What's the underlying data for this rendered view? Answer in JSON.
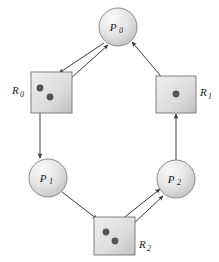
{
  "figure": {
    "background": "#ffffff",
    "width": 219,
    "height": 262
  },
  "style": {
    "process_fill_light": "#f0f0f0",
    "process_fill_dark": "#c9c9c9",
    "resource_fill_light": "#ededed",
    "resource_fill_dark": "#c2c2c2",
    "stroke": "#6e6e6e",
    "edge_color": "#3a3a3a",
    "dot_color": "#555555",
    "text_color": "#1a1a1a"
  },
  "processes": [
    {
      "id": "p0",
      "label": "P",
      "sub": "0",
      "cx": 118,
      "cy": 27,
      "r": 19
    },
    {
      "id": "p1",
      "label": "P",
      "sub": "1",
      "cx": 48,
      "cy": 178,
      "r": 19
    },
    {
      "id": "p2",
      "label": "P",
      "sub": "2",
      "cx": 176,
      "cy": 179,
      "r": 19
    }
  ],
  "resources": [
    {
      "id": "r0",
      "label": "R",
      "sub": "0",
      "x": 31,
      "y": 72,
      "w": 41,
      "h": 41,
      "label_x": 12,
      "label_y": 94,
      "instances": [
        {
          "cx": 40,
          "cy": 88
        },
        {
          "cx": 50,
          "cy": 97
        }
      ]
    },
    {
      "id": "r1",
      "label": "R",
      "sub": "1",
      "x": 156,
      "y": 76,
      "w": 40,
      "h": 37,
      "label_x": 200,
      "label_y": 96,
      "instances": [
        {
          "cx": 176,
          "cy": 94
        }
      ]
    },
    {
      "id": "r2",
      "label": "R",
      "sub": "2",
      "x": 94,
      "y": 217,
      "w": 41,
      "h": 38,
      "label_x": 139,
      "label_y": 248,
      "instances": [
        {
          "cx": 106,
          "cy": 232
        },
        {
          "cx": 115,
          "cy": 241
        }
      ]
    }
  ],
  "edges": [
    {
      "id": "edge-p0-to-r0",
      "kind": "request",
      "from": "p0",
      "to": "r0",
      "x1": 104,
      "y1": 43,
      "x2": 59,
      "y2": 73
    },
    {
      "id": "edge-r0-to-p0",
      "kind": "assignment",
      "from": "r0",
      "to": "p0",
      "x1": 50,
      "y1": 97,
      "x2": 108,
      "y2": 45
    },
    {
      "id": "edge-r1-to-p0",
      "kind": "assignment",
      "from": "r1",
      "to": "p0",
      "x1": 176,
      "y1": 94,
      "x2": 132,
      "y2": 42
    },
    {
      "id": "edge-r0-to-p1",
      "kind": "assignment",
      "from": "r0",
      "to": "p1",
      "x1": 40,
      "y1": 88,
      "x2": 40,
      "y2": 158
    },
    {
      "id": "edge-p2-to-r1",
      "kind": "request",
      "from": "p2",
      "to": "r1",
      "x1": 176,
      "y1": 160,
      "x2": 176,
      "y2": 114
    },
    {
      "id": "edge-p1-to-r2",
      "kind": "request",
      "from": "p1",
      "to": "r2",
      "x1": 62,
      "y1": 192,
      "x2": 97,
      "y2": 219
    },
    {
      "id": "edge-r2-to-p2-a",
      "kind": "assignment",
      "from": "r2",
      "to": "p2",
      "x1": 106,
      "y1": 232,
      "x2": 160,
      "y2": 189
    },
    {
      "id": "edge-r2-to-p2-b",
      "kind": "assignment",
      "from": "r2",
      "to": "p2",
      "x1": 115,
      "y1": 241,
      "x2": 163,
      "y2": 196
    }
  ]
}
